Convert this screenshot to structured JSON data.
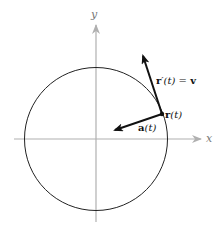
{
  "diagram": {
    "type": "vector-diagram",
    "axes": {
      "x_label": "x",
      "y_label": "y",
      "color": "#aaaaaa"
    },
    "circle": {
      "center": [
        96,
        139
      ],
      "radius": 72,
      "stroke": "#222222"
    },
    "point": {
      "label_bold": "r",
      "label_rest": "(t)",
      "position": [
        162,
        114
      ]
    },
    "vectors": [
      {
        "name": "velocity",
        "label_bold": "r",
        "label_rest": "′(t)",
        "label_eq": " = ",
        "label_v": "v",
        "from": [
          162,
          114
        ],
        "to": [
          142,
          53
        ]
      },
      {
        "name": "acceleration",
        "label_bold": "a",
        "label_rest": "(t)",
        "from": [
          162,
          114
        ],
        "to": [
          112,
          131
        ]
      }
    ]
  }
}
